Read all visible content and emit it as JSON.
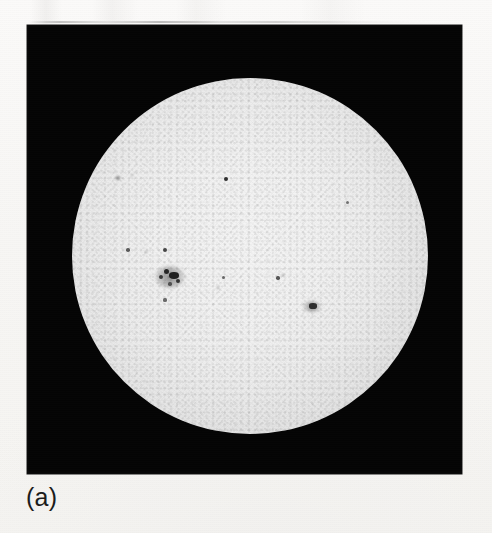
{
  "figure": {
    "panel_label": "(a)",
    "plate_background_color": "#040404",
    "page_background_color": "#f8f7f5",
    "disk_color": "#f2f2f2",
    "sunspot_color": "#1f1f1f"
  },
  "plate": {
    "x": 27,
    "y": 25,
    "width": 435,
    "height": 449
  },
  "solar_disk": {
    "center_x": 223,
    "center_y": 231,
    "radius": 178,
    "limb_darkening": true
  },
  "chart_data": {
    "type": "scatter",
    "title": "",
    "xlabel": "",
    "ylabel": "",
    "legend": [],
    "grid": false,
    "annotations": [
      "(a)"
    ],
    "series": [
      {
        "name": "sunspots",
        "points": [
          {
            "id": "spot-nw-1",
            "x": 91,
            "y": 153,
            "size": 3.4,
            "intensity": 0.38
          },
          {
            "id": "spot-nw-2",
            "x": 105,
            "y": 150,
            "size": 2.4,
            "intensity": 0.3
          },
          {
            "id": "spot-center-1",
            "x": 199,
            "y": 154,
            "size": 4.2,
            "intensity": 0.92
          },
          {
            "id": "spot-e-limb-1",
            "x": 320,
            "y": 177,
            "size": 3.0,
            "intensity": 0.55
          },
          {
            "id": "spot-w-1",
            "x": 101,
            "y": 225,
            "size": 3.6,
            "intensity": 0.68
          },
          {
            "id": "spot-w-2",
            "x": 119,
            "y": 227,
            "size": 2.6,
            "intensity": 0.4
          },
          {
            "id": "spot-w-3",
            "x": 138,
            "y": 225,
            "size": 4.0,
            "intensity": 0.8
          },
          {
            "id": "group-main-a",
            "x": 139,
            "y": 246,
            "size": 5.0,
            "intensity": 0.95
          },
          {
            "id": "group-main-b",
            "x": 145,
            "y": 250,
            "size": 7.0,
            "intensity": 1.0
          },
          {
            "id": "group-main-c",
            "x": 134,
            "y": 252,
            "size": 4.0,
            "intensity": 0.85
          },
          {
            "id": "group-main-d",
            "x": 151,
            "y": 256,
            "size": 4.6,
            "intensity": 0.88
          },
          {
            "id": "group-main-e",
            "x": 143,
            "y": 259,
            "size": 3.4,
            "intensity": 0.7
          },
          {
            "id": "spot-s-1",
            "x": 138,
            "y": 275,
            "size": 3.2,
            "intensity": 0.6
          },
          {
            "id": "spot-sc-1",
            "x": 196,
            "y": 252,
            "size": 3.0,
            "intensity": 0.62
          },
          {
            "id": "spot-sc-2",
            "x": 191,
            "y": 263,
            "size": 2.6,
            "intensity": 0.48
          },
          {
            "id": "spot-se-1",
            "x": 251,
            "y": 253,
            "size": 3.4,
            "intensity": 0.72
          },
          {
            "id": "spot-se-2",
            "x": 256,
            "y": 250,
            "size": 2.4,
            "intensity": 0.5
          },
          {
            "id": "spot-se-limb-1",
            "x": 285,
            "y": 281,
            "size": 5.2,
            "intensity": 0.9
          }
        ]
      }
    ]
  }
}
